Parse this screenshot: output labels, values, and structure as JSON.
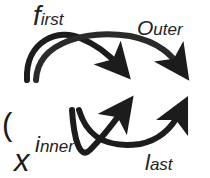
{
  "diagram": {
    "expression": {
      "left_factor": {
        "open": "(",
        "var": "x",
        "op": "+",
        "const": "2",
        "close": ")"
      },
      "right_factor": {
        "open": "(",
        "coef": "2",
        "var": "x",
        "op": "−",
        "const": "3",
        "close": ")"
      }
    },
    "labels": {
      "first": {
        "initial": "f",
        "rest": "irst"
      },
      "outer": {
        "initial": "O",
        "rest": "uter"
      },
      "inner": {
        "initial": "i",
        "rest": "nner"
      },
      "last": {
        "initial": "l",
        "rest": "ast"
      }
    },
    "arrows": [
      {
        "name": "first",
        "from": "x",
        "to": "2x"
      },
      {
        "name": "outer",
        "from": "x",
        "to": "-3"
      },
      {
        "name": "inner",
        "from": "2",
        "to": "2x"
      },
      {
        "name": "last",
        "from": "2",
        "to": "-3"
      }
    ],
    "colors": {
      "arrow": "#1c1c1c",
      "text": "#1a1a1a",
      "background": "#ffffff"
    }
  }
}
